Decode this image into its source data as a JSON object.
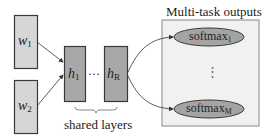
{
  "diagram": {
    "inputs": [
      {
        "id": "w1",
        "base": "w",
        "sub": "1"
      },
      {
        "id": "w2",
        "base": "w",
        "sub": "2"
      }
    ],
    "shared_layers": {
      "label": "shared layers",
      "layers": [
        {
          "id": "h1",
          "base": "h",
          "sub": "1"
        },
        {
          "id": "hR",
          "base": "h",
          "sub": "R"
        }
      ],
      "ellipsis": "···"
    },
    "outputs": {
      "title": "Multi-task outputs",
      "nodes": [
        {
          "id": "softmax1",
          "base": "softmax",
          "sub": "1"
        },
        {
          "id": "softmaxM",
          "base": "softmax",
          "sub": "M"
        }
      ],
      "ellipsis": "⋮"
    },
    "colors": {
      "input_fill": "#d6d6d6",
      "layer_fill": "#a8a8a8",
      "panel_fill": "#f1f1f1",
      "ellipse_fill": "#a4a4a4",
      "stroke": "#3a3a3a"
    }
  }
}
